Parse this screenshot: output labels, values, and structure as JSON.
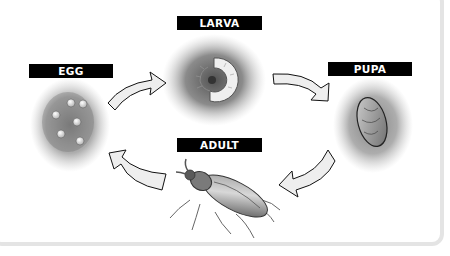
{
  "diagram": {
    "type": "life-cycle",
    "stages": [
      {
        "id": "egg",
        "label": "EGG"
      },
      {
        "id": "larva",
        "label": "LARVA"
      },
      {
        "id": "pupa",
        "label": "PUPA"
      },
      {
        "id": "adult",
        "label": "ADULT"
      }
    ],
    "arrows": [
      {
        "from": "EGG",
        "to": "LARVA"
      },
      {
        "from": "LARVA",
        "to": "PUPA"
      },
      {
        "from": "PUPA",
        "to": "ADULT"
      },
      {
        "from": "ADULT",
        "to": "EGG"
      }
    ],
    "colors": {
      "label_bg": "#000000",
      "label_text": "#ffffff",
      "panel_border": "#e4e4e4",
      "arrow_fill": "#eeeeee"
    }
  }
}
